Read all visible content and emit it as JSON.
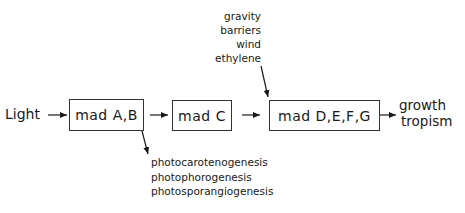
{
  "diagram": {
    "input": "Light",
    "nodes": [
      {
        "id": "madAB",
        "label": "mad A,B"
      },
      {
        "id": "madC",
        "label": "mad C"
      },
      {
        "id": "madDEFG",
        "label": "mad D,E,F,G"
      }
    ],
    "output": {
      "line1": "growth",
      "line2": "tropism"
    },
    "environmental_factors": [
      "gravity",
      "barriers",
      "wind",
      "ethylene"
    ],
    "madAB_products": [
      "photocarotenogenesis",
      "photophorogenesis",
      "photosporangiogenesis"
    ],
    "edges": [
      {
        "from": "Light",
        "to": "madAB"
      },
      {
        "from": "madAB",
        "to": "madC"
      },
      {
        "from": "madC",
        "to": "madDEFG"
      },
      {
        "from": "madDEFG",
        "to": "growth tropism"
      },
      {
        "from": "environmental_factors",
        "to": "madDEFG"
      },
      {
        "from": "madAB",
        "to": "madAB_products"
      }
    ],
    "colors": {
      "line": "#1a1a1a",
      "background": "#ffffff"
    }
  }
}
